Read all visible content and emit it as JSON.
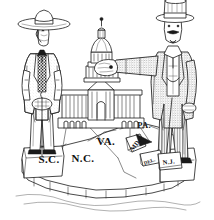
{
  "artwork": {
    "title": "Sectional Cartoon: Planter and Northern Gentleman over the Capitol",
    "medium": "black and white line engraving",
    "background_color": "#ffffff",
    "ink_color": "#1a1a1a",
    "width": 214,
    "height": 220
  },
  "figures": {
    "left": {
      "name": "southern-planter",
      "headwear": "wide-brimmed planter hat",
      "attributes": "long frock coat, patterned vest, bow cravat, walking cane",
      "stance": "standing on South Carolina block",
      "shading": "light stipple"
    },
    "right": {
      "name": "northern-gentleman",
      "headwear": "tall stovepipe top hat",
      "attributes": "mustache and chin beard, long tailcoat, striped trousers, pointed shoes",
      "stance": "standing on Pennsylvania and New Jersey blocks",
      "gesture": "right arm extended, hand grasping the Capitol dome",
      "shading": "heavy stipple"
    }
  },
  "capitol": {
    "name": "united-states-capitol",
    "label": "U.S. Capitol",
    "features": "central dome with lantern and statue, colonnaded wings, arched basement windows"
  },
  "map": {
    "caption": "stylized block map of eastern seaboard states",
    "states": [
      {
        "id": "sc",
        "label": "S.C.",
        "x": 49,
        "y": 163,
        "size": "lbl-lg",
        "rotate": 0
      },
      {
        "id": "nc",
        "label": "N.C.",
        "x": 83,
        "y": 162,
        "size": "lbl-lg",
        "rotate": 0
      },
      {
        "id": "va",
        "label": "VA.",
        "x": 106,
        "y": 145,
        "size": "lbl-lg",
        "rotate": 0
      },
      {
        "id": "pa",
        "label": "PA.",
        "x": 144,
        "y": 128,
        "size": "lbl-md",
        "rotate": 0
      },
      {
        "id": "md",
        "label": "MD.",
        "x": 137,
        "y": 146,
        "size": "lbl-sm",
        "rotate": -52
      },
      {
        "id": "del",
        "label": "DEL.",
        "x": 150,
        "y": 163,
        "size": "lbl-xs",
        "rotate": -20
      },
      {
        "id": "nj",
        "label": "N.J.",
        "x": 169,
        "y": 164,
        "size": "lbl-sm",
        "rotate": -8
      }
    ],
    "base": "stepped coastal blocks with water hatching below"
  }
}
